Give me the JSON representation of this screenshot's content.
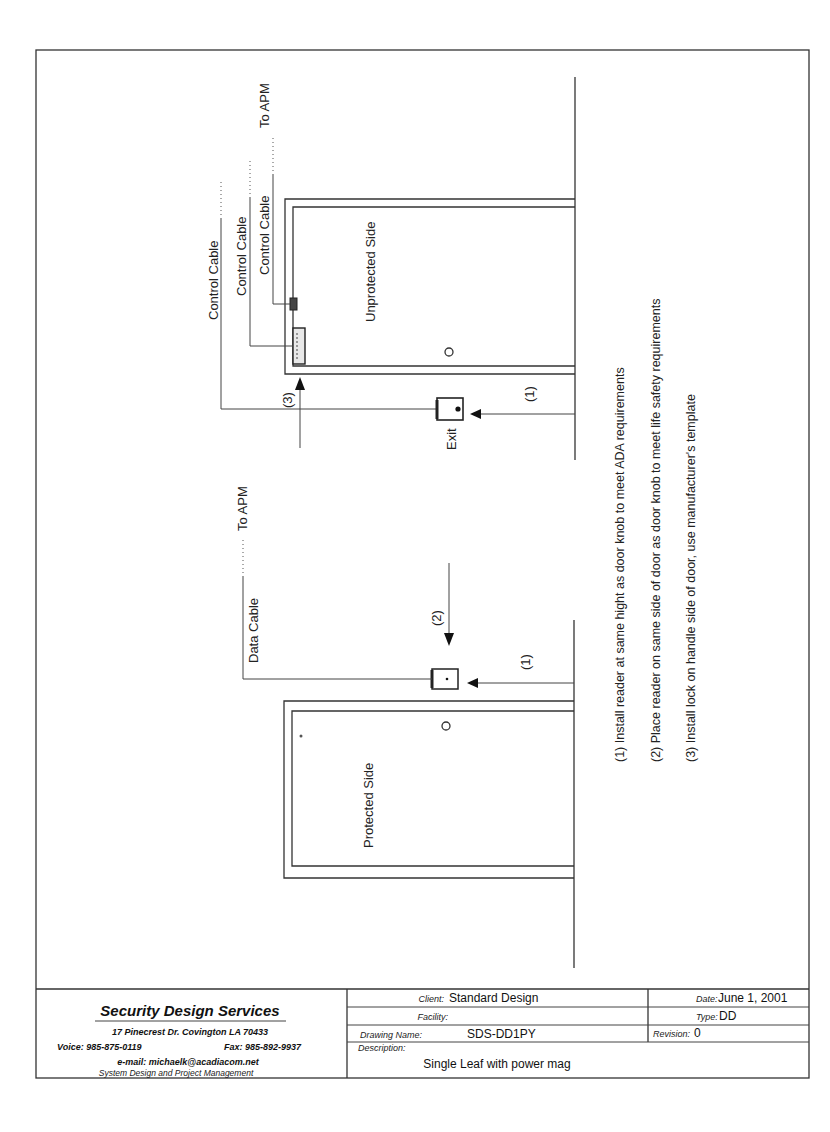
{
  "drawing": {
    "unprotected_side": {
      "room_label": "Unprotected Side",
      "exit_device_label": "Exit",
      "cables": [
        {
          "label": "Control Cable"
        },
        {
          "label": "Control Cable"
        },
        {
          "label": "Control Cable"
        }
      ],
      "destination_label": "To APM",
      "callouts": {
        "reader_height": "(1)",
        "lock": "(3)"
      }
    },
    "protected_side": {
      "room_label": "Protected Side",
      "cable_label": "Data Cable",
      "destination_label": "To APM",
      "callouts": {
        "reader_height": "(1)",
        "reader_side": "(2)"
      }
    },
    "notes": [
      "(1)  Install reader at same hight as door knob to meet ADA requirements",
      "(2)  Place reader on same side of door as door knob to meet life safety requirements",
      "(3)  Install lock on handle side of door, use manufacturer's template"
    ]
  },
  "title_block": {
    "company": {
      "name": "Security Design Services",
      "address": "17 Pinecrest Dr.  Covington LA 70433",
      "voice": "Voice: 985-875-0119",
      "fax": "Fax: 985-892-9937",
      "email": "e-mail: michaelk@acadiacom.net",
      "tagline": "System Design and Project Management"
    },
    "client_label": "Client:",
    "client_value": "Standard Design",
    "facility_label": "Facility:",
    "facility_value": "",
    "drawing_name_label": "Drawing Name:",
    "drawing_name_value": "SDS-DD1PY",
    "description_label": "Description:",
    "description_value": "Single Leaf with power mag",
    "date_label": "Date:",
    "date_value": "June 1, 2001",
    "type_label": "Type:",
    "type_value": "DD",
    "revision_label": "Revision:",
    "revision_value": "0"
  }
}
